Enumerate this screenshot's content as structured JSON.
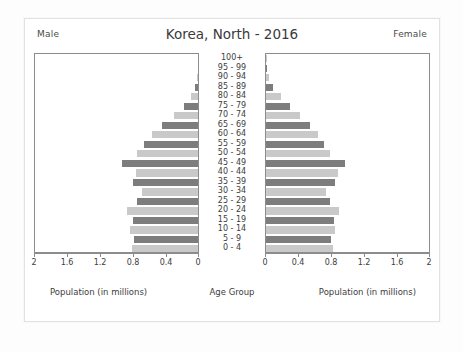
{
  "header": {
    "male_label": "Male",
    "female_label": "Female",
    "title": "Korea, North - 2016"
  },
  "captions": {
    "left": "Population (in millions)",
    "center": "Age Group",
    "right": "Population (in millions)"
  },
  "colors": {
    "bar_dark": "#7d7d7d",
    "bar_light": "#c9c9c9",
    "axis": "#8c8c8c",
    "text": "#3d3d3d",
    "card_bg": "#ffffff",
    "page_bg": "#fdfdfd"
  },
  "axis": {
    "male_ticks": [
      "2",
      "1.6",
      "1.2",
      "0.8",
      "0.4",
      "0"
    ],
    "female_ticks": [
      "0",
      "0.4",
      "0.8",
      "1.2",
      "1.6",
      "2"
    ],
    "max": 2,
    "unit": "millions"
  },
  "chart_data": {
    "type": "bar",
    "subtype": "population-pyramid",
    "title": "Korea, North - 2016",
    "xlabel": "Population (in millions)",
    "ylabel": "Age Group",
    "xlim": [
      0,
      2
    ],
    "grid": false,
    "legend": [
      "Male",
      "Female"
    ],
    "legend_position": "top-corners",
    "categories": [
      "100+",
      "95 - 99",
      "90 - 94",
      "85 - 89",
      "80 - 84",
      "75 - 79",
      "70 - 74",
      "65 - 69",
      "60 - 64",
      "55 - 59",
      "50 - 54",
      "45 - 49",
      "40 - 44",
      "35 - 39",
      "30 - 34",
      "25 - 29",
      "20 - 24",
      "15 - 19",
      "10 - 14",
      "5 - 9",
      "0 - 4"
    ],
    "series": [
      {
        "name": "Male",
        "side": "left",
        "values": [
          0.001,
          0.004,
          0.012,
          0.035,
          0.085,
          0.175,
          0.295,
          0.445,
          0.565,
          0.665,
          0.745,
          0.93,
          0.76,
          0.8,
          0.69,
          0.745,
          0.87,
          0.8,
          0.83,
          0.79,
          0.81
        ]
      },
      {
        "name": "Female",
        "side": "right",
        "values": [
          0.002,
          0.01,
          0.035,
          0.09,
          0.19,
          0.3,
          0.42,
          0.545,
          0.64,
          0.715,
          0.79,
          0.97,
          0.88,
          0.85,
          0.74,
          0.79,
          0.9,
          0.83,
          0.845,
          0.8,
          0.82
        ]
      }
    ]
  }
}
